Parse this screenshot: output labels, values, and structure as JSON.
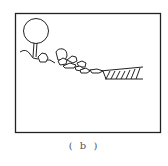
{
  "figure": {
    "caption": "( b )",
    "stroke_color": "#222222",
    "background": "#ffffff",
    "elements": [
      "tree",
      "slope-ground",
      "rocks",
      "hatched-water-edge"
    ]
  }
}
